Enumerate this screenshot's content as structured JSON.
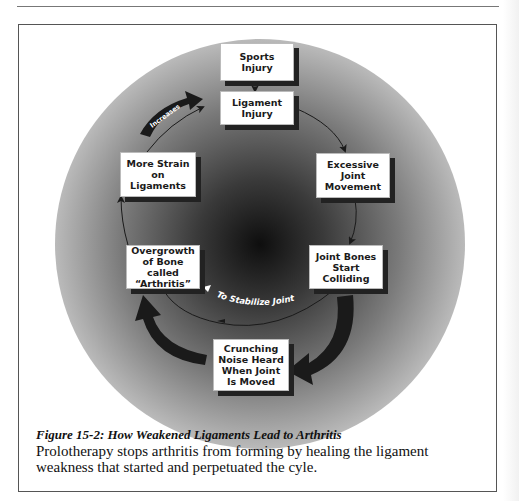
{
  "figure": {
    "nodes": [
      {
        "id": "sports-injury",
        "label": "Sports Injury"
      },
      {
        "id": "ligament-injury",
        "label": "Ligament Injury"
      },
      {
        "id": "excessive-joint-movement",
        "label": "Excessive Joint Movement"
      },
      {
        "id": "joint-bones-colliding",
        "label": "Joint Bones Start Colliding"
      },
      {
        "id": "crunching-noise",
        "label": "Crunching Noise Heard When Joint Is Moved"
      },
      {
        "id": "bone-overgrowth",
        "label": "Overgrowth of Bone called “Arthritis”"
      },
      {
        "id": "more-strain",
        "label": "More Strain on Ligaments"
      }
    ],
    "arrow_labels": {
      "increases": "Increases",
      "stabilize": "To Stabilize Joint"
    },
    "colors": {
      "shadow": "#222222",
      "arrow": "#1a1a1a",
      "frame": "#555555"
    }
  },
  "caption": {
    "title": "Figure 15-2:  How Weakened Ligaments Lead to Arthritis",
    "body": "Prolotherapy stops arthritis from forming by healing the ligament weakness that started and perpetuated the cyle."
  }
}
